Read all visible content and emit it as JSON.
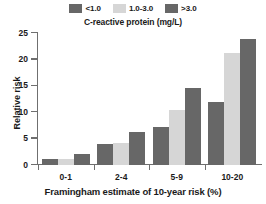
{
  "chart_data": {
    "type": "bar",
    "title": "",
    "legend_title": "C-reactive protein (mg/L)",
    "legend_position": "top",
    "grid": false,
    "xlabel": "Framingham estimate of 10-year risk (%)",
    "ylabel": "Relative risk",
    "categories": [
      "0-1",
      "2-4",
      "5-9",
      "10-20"
    ],
    "yticks": [
      0,
      5,
      10,
      15,
      20,
      25
    ],
    "ytick_labels": [
      "0",
      "5",
      "10",
      "15",
      "20",
      "25"
    ],
    "ylim": [
      0,
      25
    ],
    "series": [
      {
        "name": "<1.0",
        "color": "#676767",
        "values": [
          1.1,
          3.9,
          7.2,
          12.0
        ]
      },
      {
        "name": "1.0-3.0",
        "color": "#d6d6d6",
        "values": [
          1.1,
          4.1,
          10.4,
          21.2
        ]
      },
      {
        "name": ">3.0",
        "color": "#676767",
        "values": [
          2.0,
          6.2,
          14.6,
          23.8
        ]
      }
    ]
  },
  "colors": {
    "axis": "#6f6f6f",
    "text": "#1a1a1a",
    "background": "#ffffff",
    "dark_bar": "#676767",
    "light_bar": "#d6d6d6"
  }
}
